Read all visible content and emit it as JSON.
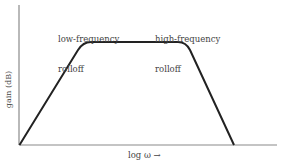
{
  "diagram": {
    "title": "",
    "axes": {
      "y_label": "gain (dB)",
      "x_label": "log ω →"
    },
    "annotations": {
      "low_frequency": {
        "line1": "low-frequency",
        "line2": "rolloff"
      },
      "high_frequency": {
        "line1": "high-frequency",
        "line2": "rolloff"
      }
    },
    "curve": {
      "description": "Band-pass gain response: linear rise (low-frequency rolloff), flat passband, linear fall (high-frequency rolloff)",
      "stroke_color": "#222222",
      "axis_color": "#888888"
    }
  }
}
